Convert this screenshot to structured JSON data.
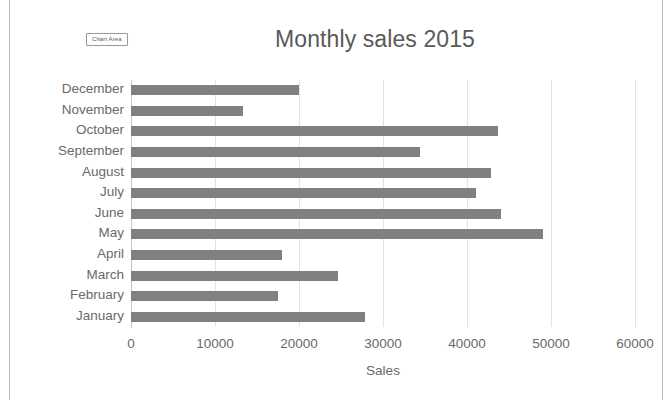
{
  "chart_area_badge": "Chart Area",
  "chart_data": {
    "type": "bar",
    "orientation": "horizontal",
    "title": "Monthly sales 2015",
    "xlabel": "Sales",
    "ylabel": "",
    "xlim": [
      0,
      60000
    ],
    "xticks": [
      0,
      10000,
      20000,
      30000,
      40000,
      50000,
      60000
    ],
    "xticklabels": [
      "0",
      "10000",
      "20000",
      "30000",
      "40000",
      "50000",
      "60000"
    ],
    "grid": true,
    "legend": false,
    "bar_color": "#808080",
    "gridline_color": "#e2e2e2",
    "axis_color": "#c6c6c6",
    "text_color": "#6a6a6a",
    "title_color": "#595959",
    "categories": [
      "December",
      "November",
      "October",
      "September",
      "August",
      "July",
      "June",
      "May",
      "April",
      "March",
      "February",
      "January"
    ],
    "values": [
      20000,
      13300,
      43700,
      34400,
      42900,
      41100,
      44000,
      49000,
      18000,
      24600,
      17500,
      27900
    ],
    "series": [
      {
        "name": "Sales",
        "values": [
          20000,
          13300,
          43700,
          34400,
          42900,
          41100,
          44000,
          49000,
          18000,
          24600,
          17500,
          27900
        ]
      }
    ]
  }
}
